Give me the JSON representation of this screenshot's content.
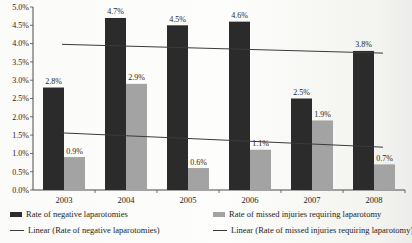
{
  "chart_data": {
    "type": "bar",
    "title": "",
    "xlabel": "",
    "ylabel": "",
    "categories": [
      "2003",
      "2004",
      "2005",
      "2006",
      "2007",
      "2008"
    ],
    "series": [
      {
        "name": "Rate of negative laparotomies",
        "color": "#2b2b2b",
        "values": [
          2.8,
          4.7,
          4.5,
          4.6,
          2.5,
          3.8
        ],
        "labels": [
          "2.8%",
          "4.7%",
          "4.5%",
          "4.6%",
          "2.5%",
          "3.8%"
        ]
      },
      {
        "name": "Rate of missed injuries requiring laparotomy",
        "color": "#a3a3a3",
        "values": [
          0.9,
          2.9,
          0.6,
          1.1,
          1.9,
          0.7
        ],
        "labels": [
          "0.9%",
          "2.9%",
          "0.6%",
          "1.1%",
          "1.9%",
          "0.7%"
        ]
      }
    ],
    "trendlines": [
      {
        "name": "Linear (Rate of negative laparotomies)",
        "start_value": 3.98,
        "end_value": 3.74,
        "color": "#3a3a3a"
      },
      {
        "name": "Linear (Rate of missed injuries requiring laparotomy)",
        "start_value": 1.56,
        "end_value": 1.17,
        "color": "#3a3a3a"
      }
    ],
    "y_axis": {
      "min": 0,
      "max": 5,
      "step": 0.5,
      "tick_labels": [
        "0.0%",
        "0.5%",
        "1.0%",
        "1.5%",
        "2.0%",
        "2.5%",
        "3.0%",
        "3.5%",
        "4.0%",
        "4.5%",
        "5.0%"
      ]
    },
    "grid": false,
    "legend_position": "bottom"
  },
  "legend": {
    "items": [
      {
        "label": "Rate of negative laparotomies",
        "swatch": "bar",
        "color": "#2b2b2b"
      },
      {
        "label": "Rate of missed injuries requiring laparotomy",
        "swatch": "bar",
        "color": "#a3a3a3"
      },
      {
        "label": "Linear (Rate of negative laparotomies)",
        "swatch": "line",
        "color": "#3a3a3a"
      },
      {
        "label": "Linear (Rate of missed injuries requiring laparotomy)",
        "swatch": "line",
        "color": "#3a3a3a"
      }
    ]
  },
  "colors": {
    "axis": "#4a4a4a",
    "text": "#1c1c1c",
    "background": "#fbfbf9"
  }
}
